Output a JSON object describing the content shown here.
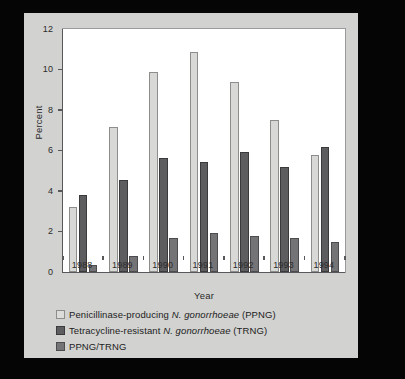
{
  "figure": {
    "background_color": "#050505",
    "panel_color": "#d2d2d0",
    "plot_background_color": "#ffffff"
  },
  "chart_data": {
    "type": "bar",
    "title": "",
    "subtitle": "",
    "xlabel": "Year",
    "ylabel": "Percent",
    "categories": [
      "1988",
      "1989",
      "1990",
      "1991",
      "1992",
      "1993",
      "1994"
    ],
    "series": [
      {
        "name": "Penicillinase-producing N. gonorrhoeae (PPNG)",
        "name_prefix": "Penicillinase-producing ",
        "name_italic": "N. gonorrhoeae",
        "name_suffix": " (PPNG)",
        "color": "#d8d8d6",
        "values": [
          3.2,
          7.15,
          9.9,
          10.85,
          9.4,
          7.5,
          5.8
        ]
      },
      {
        "name": "Tetracycline-resistant N. gonorrhoeae (TRNG)",
        "name_prefix": "Tetracycline-resistant ",
        "name_italic": "N. gonorrhoeae",
        "name_suffix": " (TRNG)",
        "color": "#5d5d60",
        "values": [
          3.8,
          4.55,
          5.65,
          5.45,
          5.95,
          5.2,
          6.15
        ]
      },
      {
        "name": "PPNG/TRNG",
        "name_prefix": "PPNG/TRNG",
        "name_italic": "",
        "name_suffix": "",
        "color": "#747477",
        "values": [
          0.35,
          0.8,
          1.7,
          1.95,
          1.8,
          1.7,
          1.5
        ]
      }
    ],
    "ylim": [
      0,
      12
    ],
    "yticks": [
      0,
      2,
      4,
      6,
      8,
      10,
      12
    ],
    "ytick_labels": [
      "0",
      "2",
      "4",
      "6",
      "8",
      "10",
      "12"
    ],
    "grid": false,
    "legend_position": "below"
  }
}
